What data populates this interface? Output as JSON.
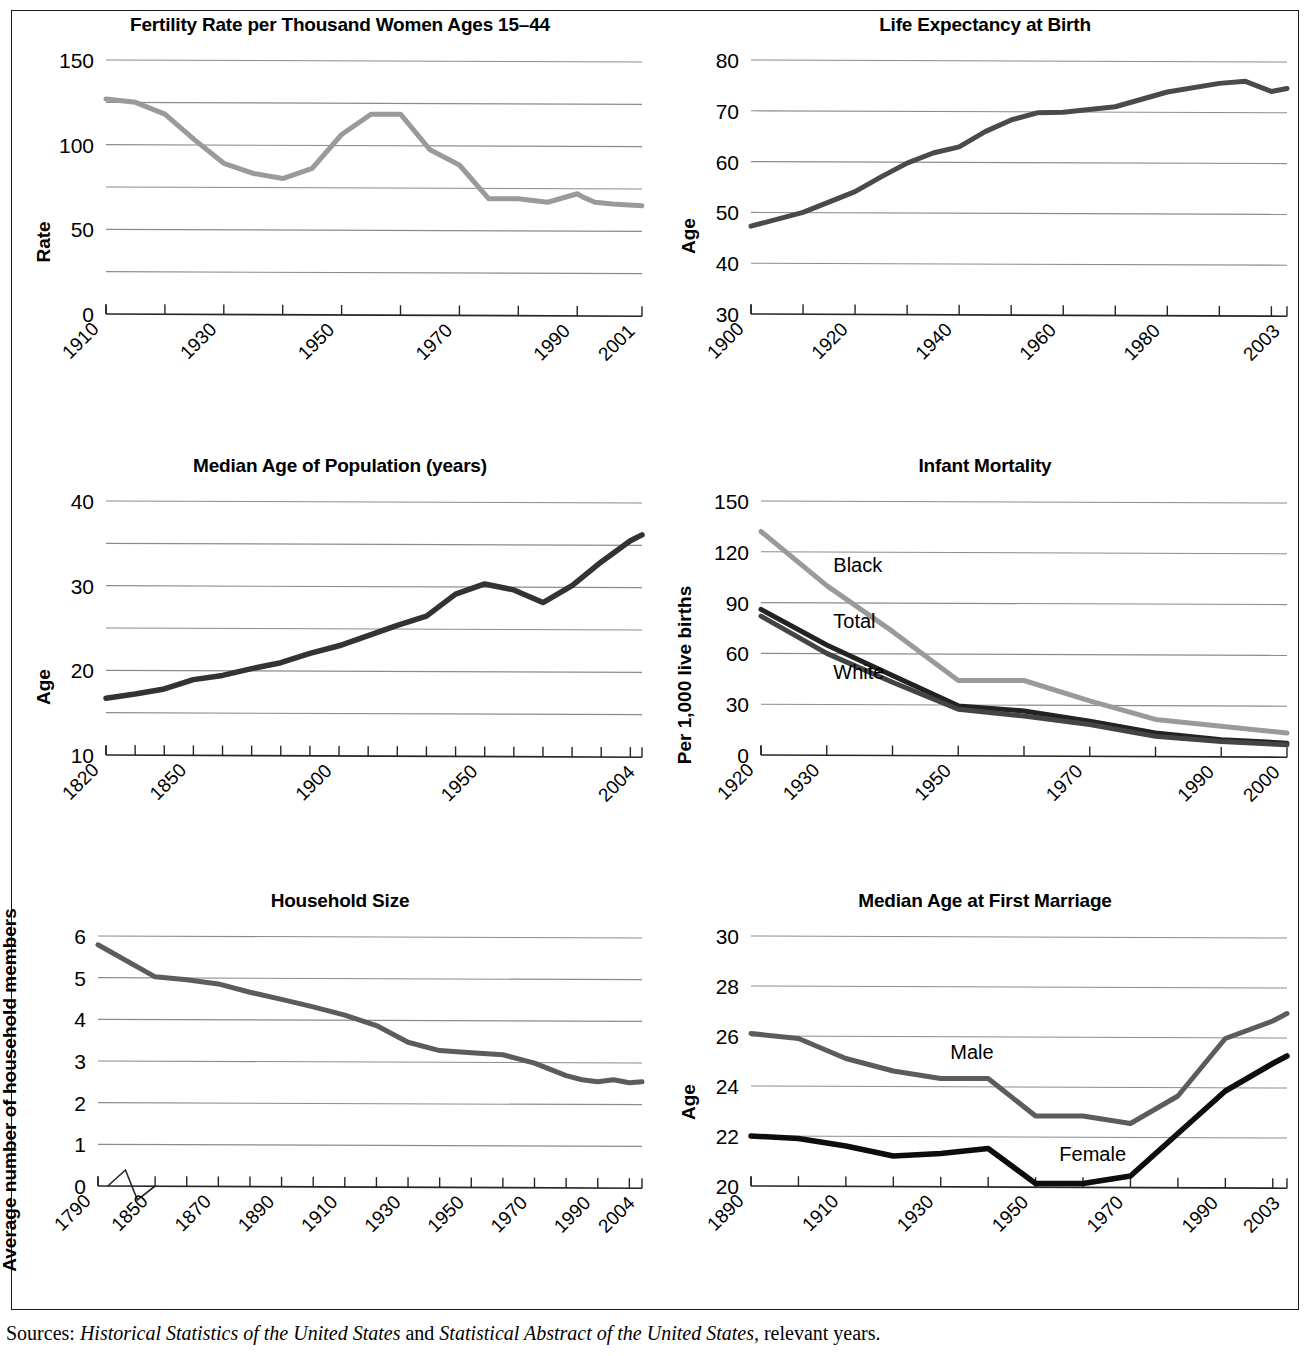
{
  "figure": {
    "sources_prefix": "Sources:",
    "sources_part1": "Historical Statistics of the United States",
    "sources_mid": " and ",
    "sources_part2": "Statistical Abstract of the United States",
    "sources_suffix": ", relevant years.",
    "sources_full": "Sources: Historical Statistics of the United States and Statistical Abstract of the United States, relevant years.",
    "colors": {
      "gray_line": "#9a9a9a",
      "mid_gray_line": "#6b6b6b",
      "dark_line": "#333333",
      "black_line": "#111111",
      "gridline": "#8c8c8c",
      "axis": "#262626",
      "text": "#000000",
      "background": "#ffffff"
    }
  },
  "chart_data": [
    {
      "id": "fertility-rate",
      "type": "line",
      "title": "Fertility Rate per Thousand Women Ages 15–44",
      "xlabel": "",
      "ylabel": "Rate",
      "ylim": [
        0,
        150
      ],
      "yticks": [
        0,
        50,
        100,
        150
      ],
      "ytick_labels": [
        "0",
        "50",
        "100",
        "150"
      ],
      "gridlines": [
        25,
        50,
        75,
        100,
        125,
        150
      ],
      "grid": true,
      "xlim": [
        1910,
        2001
      ],
      "xticks": [
        1910,
        1920,
        1930,
        1940,
        1950,
        1960,
        1970,
        1980,
        1990,
        2001
      ],
      "xtick_labels": [
        "1910",
        "",
        "1930",
        "",
        "1950",
        "",
        "1970",
        "",
        "1990",
        "2001"
      ],
      "legend": "none",
      "series": [
        {
          "name": "Fertility rate",
          "color": "#9a9a9a",
          "width": 5,
          "x": [
            1910,
            1915,
            1920,
            1925,
            1930,
            1935,
            1940,
            1945,
            1950,
            1955,
            1960,
            1965,
            1970,
            1975,
            1980,
            1985,
            1990,
            1991,
            1993,
            1996,
            2001
          ],
          "values": [
            127,
            125,
            118,
            103,
            89,
            83,
            80,
            86,
            106,
            118,
            118,
            97,
            88,
            68,
            68,
            66,
            71,
            69,
            66,
            65,
            64
          ]
        }
      ]
    },
    {
      "id": "life-expectancy",
      "type": "line",
      "title": "Life Expectancy at Birth",
      "xlabel": "",
      "ylabel": "Age",
      "ylim": [
        30,
        80
      ],
      "yticks": [
        30,
        40,
        50,
        60,
        70,
        80
      ],
      "ytick_labels": [
        "30",
        "40",
        "50",
        "60",
        "70",
        "80"
      ],
      "gridlines": [
        40,
        50,
        60,
        70,
        80
      ],
      "grid": true,
      "xlim": [
        1900,
        2003
      ],
      "xticks": [
        1900,
        1910,
        1920,
        1930,
        1940,
        1950,
        1960,
        1970,
        1980,
        1990,
        2000,
        2003
      ],
      "xtick_labels": [
        "1900",
        "",
        "1920",
        "",
        "1940",
        "",
        "1960",
        "",
        "1980",
        "",
        "",
        "2003"
      ],
      "legend": "none",
      "series": [
        {
          "name": "Life expectancy",
          "color": "#4a4a4a",
          "width": 5,
          "x": [
            1900,
            1910,
            1920,
            1925,
            1930,
            1935,
            1940,
            1945,
            1950,
            1955,
            1960,
            1970,
            1980,
            1990,
            1995,
            2000,
            2003
          ],
          "values": [
            47.3,
            50.0,
            54.1,
            57.0,
            59.7,
            61.7,
            62.9,
            65.9,
            68.2,
            69.6,
            69.7,
            70.8,
            73.7,
            75.4,
            75.8,
            73.8,
            74.4
          ]
        }
      ]
    },
    {
      "id": "median-age-population",
      "type": "line",
      "title": "Median Age of Population (years)",
      "xlabel": "",
      "ylabel": "Age",
      "ylim": [
        10,
        40
      ],
      "yticks": [
        10,
        20,
        30,
        40
      ],
      "ytick_labels": [
        "10",
        "20",
        "30",
        "40"
      ],
      "gridlines": [
        15,
        20,
        25,
        30,
        35,
        40
      ],
      "grid": true,
      "xlim": [
        1820,
        2004
      ],
      "xticks": [
        1820,
        1830,
        1840,
        1850,
        1860,
        1870,
        1880,
        1890,
        1900,
        1910,
        1920,
        1930,
        1940,
        1950,
        1960,
        1970,
        1980,
        1990,
        2000,
        2004
      ],
      "xtick_labels": [
        "1820",
        "",
        "",
        "1850",
        "",
        "",
        "",
        "",
        "1900",
        "",
        "",
        "",
        "",
        "1950",
        "",
        "",
        "",
        "",
        "",
        "2004"
      ],
      "legend": "none",
      "series": [
        {
          "name": "Median age",
          "color": "#333333",
          "width": 5.5,
          "x": [
            1820,
            1830,
            1840,
            1850,
            1860,
            1870,
            1880,
            1890,
            1900,
            1910,
            1920,
            1930,
            1940,
            1950,
            1960,
            1970,
            1980,
            1990,
            2000,
            2004
          ],
          "values": [
            16.7,
            17.2,
            17.8,
            18.9,
            19.4,
            20.2,
            20.9,
            22.0,
            22.9,
            24.1,
            25.3,
            26.4,
            29.0,
            30.2,
            29.5,
            28.0,
            30.0,
            32.8,
            35.3,
            36.0
          ]
        }
      ]
    },
    {
      "id": "infant-mortality",
      "type": "line",
      "title": "Infant Mortality",
      "xlabel": "",
      "ylabel": "Per 1,000 live births",
      "ylim": [
        0,
        150
      ],
      "yticks": [
        0,
        30,
        60,
        90,
        120,
        150
      ],
      "ytick_labels": [
        "0",
        "30",
        "60",
        "90",
        "120",
        "150"
      ],
      "gridlines": [
        30,
        60,
        90,
        120,
        150
      ],
      "grid": true,
      "xlim": [
        1920,
        2000
      ],
      "xticks": [
        1920,
        1930,
        1940,
        1950,
        1960,
        1970,
        1980,
        1990,
        2000
      ],
      "xtick_labels": [
        "1920",
        "1930",
        "",
        "1950",
        "",
        "1970",
        "",
        "1990",
        "2000"
      ],
      "legend": "inline-labels",
      "series": [
        {
          "name": "Black",
          "color": "#9a9a9a",
          "width": 5,
          "label_x": 1931,
          "label_y": 108,
          "x": [
            1920,
            1930,
            1940,
            1950,
            1960,
            1970,
            1980,
            1990,
            2000
          ],
          "values": [
            132,
            100,
            73,
            44,
            44,
            32,
            21,
            17,
            13
          ]
        },
        {
          "name": "Total",
          "color": "#222222",
          "width": 5,
          "label_x": 1931,
          "label_y": 75,
          "x": [
            1920,
            1930,
            1940,
            1950,
            1960,
            1970,
            1980,
            1990,
            2000
          ],
          "values": [
            86,
            65,
            47,
            29,
            26,
            20,
            13,
            9,
            7
          ]
        },
        {
          "name": "White",
          "color": "#444444",
          "width": 5,
          "label_x": 1931,
          "label_y": 45,
          "x": [
            1920,
            1930,
            1940,
            1950,
            1960,
            1970,
            1980,
            1990,
            2000
          ],
          "values": [
            82,
            60,
            43,
            27,
            23,
            18,
            11,
            8,
            6
          ]
        }
      ]
    },
    {
      "id": "household-size",
      "type": "line",
      "title": "Household Size",
      "xlabel": "",
      "ylabel": "Average number of household members",
      "ylim": [
        0,
        6
      ],
      "yticks": [
        0,
        1,
        2,
        3,
        4,
        5,
        6
      ],
      "ytick_labels": [
        "0",
        "1",
        "2",
        "3",
        "4",
        "5",
        "6"
      ],
      "gridlines": [
        1,
        2,
        3,
        4,
        5,
        6
      ],
      "grid": true,
      "axis_break": true,
      "xlim": [
        1790,
        2004
      ],
      "xticks": [
        1790,
        1850,
        1860,
        1870,
        1880,
        1890,
        1900,
        1910,
        1920,
        1930,
        1940,
        1950,
        1960,
        1970,
        1980,
        1990,
        2000,
        2004
      ],
      "xtick_labels": [
        "1790",
        "1850",
        "",
        "1870",
        "",
        "1890",
        "",
        "1910",
        "",
        "1930",
        "",
        "1950",
        "",
        "1970",
        "",
        "1990",
        "",
        "2004"
      ],
      "legend": "none",
      "series": [
        {
          "name": "Household size",
          "color": "#5c5c5c",
          "width": 5,
          "x": [
            1790,
            1850,
            1860,
            1870,
            1880,
            1890,
            1900,
            1910,
            1920,
            1930,
            1940,
            1950,
            1960,
            1970,
            1980,
            1985,
            1990,
            1995,
            2000,
            2004
          ],
          "values": [
            5.79,
            5.02,
            4.95,
            4.85,
            4.65,
            4.48,
            4.3,
            4.1,
            3.85,
            3.45,
            3.25,
            3.2,
            3.15,
            2.95,
            2.65,
            2.55,
            2.5,
            2.55,
            2.48,
            2.5
          ]
        }
      ]
    },
    {
      "id": "median-age-first-marriage",
      "type": "line",
      "title": "Median Age at First Marriage",
      "xlabel": "",
      "ylabel": "Age",
      "ylim": [
        20,
        30
      ],
      "yticks": [
        20,
        22,
        24,
        26,
        28,
        30
      ],
      "ytick_labels": [
        "20",
        "22",
        "24",
        "26",
        "28",
        "30"
      ],
      "gridlines": [
        22,
        24,
        26,
        28,
        30
      ],
      "grid": true,
      "xlim": [
        1890,
        2003
      ],
      "xticks": [
        1890,
        1900,
        1910,
        1920,
        1930,
        1940,
        1950,
        1960,
        1970,
        1980,
        1990,
        2000,
        2003
      ],
      "xtick_labels": [
        "1890",
        "",
        "1910",
        "",
        "1930",
        "",
        "1950",
        "",
        "1970",
        "",
        "1990",
        "",
        "2003"
      ],
      "legend": "inline-labels",
      "series": [
        {
          "name": "Male",
          "color": "#5c5c5c",
          "width": 5,
          "label_x": 1932,
          "label_y": 25.1,
          "x": [
            1890,
            1900,
            1910,
            1920,
            1930,
            1940,
            1950,
            1960,
            1970,
            1980,
            1990,
            2000,
            2003
          ],
          "values": [
            26.1,
            25.9,
            25.1,
            24.6,
            24.3,
            24.3,
            22.8,
            22.8,
            22.5,
            23.6,
            25.9,
            26.6,
            26.9
          ]
        },
        {
          "name": "Female",
          "color": "#0d0d0d",
          "width": 5.5,
          "label_x": 1955,
          "label_y": 21.0,
          "x": [
            1890,
            1900,
            1910,
            1920,
            1930,
            1940,
            1950,
            1960,
            1970,
            1980,
            1990,
            2000,
            2003
          ],
          "values": [
            22.0,
            21.9,
            21.6,
            21.2,
            21.3,
            21.5,
            20.1,
            20.1,
            20.4,
            22.1,
            23.8,
            24.9,
            25.2
          ]
        }
      ]
    }
  ]
}
